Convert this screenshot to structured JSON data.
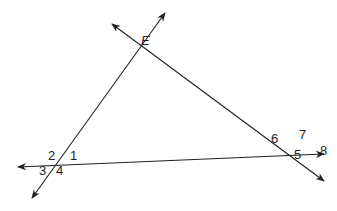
{
  "diagram": {
    "type": "geometry-three-intersecting-lines",
    "stroke_color": "#231f20",
    "background": "#ffffff",
    "point_labels": [
      {
        "id": "E",
        "text": "E",
        "italic": true
      }
    ],
    "angle_labels": [
      {
        "id": "1",
        "text": "1"
      },
      {
        "id": "2",
        "text": "2"
      },
      {
        "id": "3",
        "text": "3"
      },
      {
        "id": "4",
        "text": "4"
      },
      {
        "id": "5",
        "text": "5"
      },
      {
        "id": "6",
        "text": "6"
      },
      {
        "id": "7",
        "text": "7"
      },
      {
        "id": "8",
        "text": "8"
      }
    ],
    "lines": [
      {
        "name": "left-transversal",
        "description": "line through lower-left intersection and E, arrows both ends"
      },
      {
        "name": "right-transversal",
        "description": "line through E and lower-right intersection, arrows both ends"
      },
      {
        "name": "base-line",
        "description": "nearly horizontal line through both lower intersections, arrows both ends"
      }
    ]
  }
}
